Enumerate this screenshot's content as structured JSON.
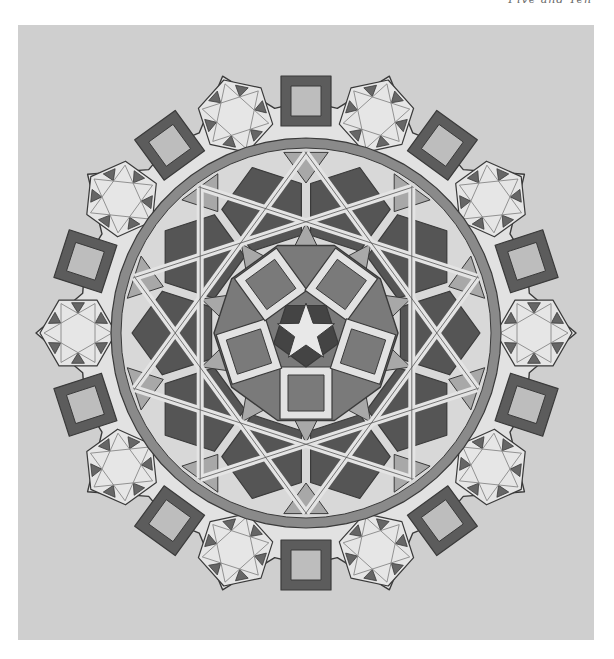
{
  "header": {
    "running_title": "Five and Ten"
  },
  "figure": {
    "center": [
      306,
      333
    ],
    "outer_units": 10,
    "colors": {
      "paper": "#cfcfcf",
      "page": "#ffffff",
      "light_band": "#e2e2e2",
      "dark_fill": "#555555",
      "mid_fill": "#7a7a7a",
      "light_fill": "#a8a8a8",
      "line": "#3a3a3a"
    }
  }
}
